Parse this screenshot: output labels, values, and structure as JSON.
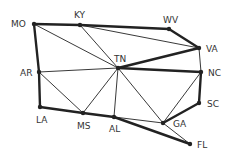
{
  "diagram": {
    "type": "graph",
    "nodes": [
      {
        "id": "MO",
        "label": "MO",
        "x": 34,
        "y": 24,
        "lx": 11,
        "ly": 19
      },
      {
        "id": "KY",
        "label": "KY",
        "x": 80,
        "y": 25,
        "lx": 74,
        "ly": 10
      },
      {
        "id": "WV",
        "label": "WV",
        "x": 169,
        "y": 29,
        "lx": 163,
        "ly": 15
      },
      {
        "id": "VA",
        "label": "VA",
        "x": 199,
        "y": 48,
        "lx": 206,
        "ly": 44
      },
      {
        "id": "TN",
        "label": "TN",
        "x": 118,
        "y": 68,
        "lx": 114,
        "ly": 54
      },
      {
        "id": "NC",
        "label": "NC",
        "x": 201,
        "y": 72,
        "lx": 208,
        "ly": 68
      },
      {
        "id": "AR",
        "label": "AR",
        "x": 39,
        "y": 72,
        "lx": 20,
        "ly": 68
      },
      {
        "id": "SC",
        "label": "SC",
        "x": 199,
        "y": 103,
        "lx": 207,
        "ly": 99
      },
      {
        "id": "LA",
        "label": "LA",
        "x": 40,
        "y": 107,
        "lx": 36,
        "ly": 115
      },
      {
        "id": "MS",
        "label": "MS",
        "x": 83,
        "y": 113,
        "lx": 77,
        "ly": 121
      },
      {
        "id": "AL",
        "label": "AL",
        "x": 114,
        "y": 117,
        "lx": 109,
        "ly": 124
      },
      {
        "id": "GA",
        "label": "GA",
        "x": 163,
        "y": 123,
        "lx": 173,
        "ly": 119
      },
      {
        "id": "FL",
        "label": "FL",
        "x": 190,
        "y": 144,
        "lx": 197,
        "ly": 140
      }
    ],
    "edges": [
      {
        "from": "MO",
        "to": "KY",
        "bold": true
      },
      {
        "from": "KY",
        "to": "WV",
        "bold": true
      },
      {
        "from": "WV",
        "to": "VA",
        "bold": true
      },
      {
        "from": "KY",
        "to": "VA",
        "bold": false
      },
      {
        "from": "MO",
        "to": "TN",
        "bold": false
      },
      {
        "from": "KY",
        "to": "TN",
        "bold": false
      },
      {
        "from": "TN",
        "to": "VA",
        "bold": true
      },
      {
        "from": "VA",
        "to": "NC",
        "bold": false
      },
      {
        "from": "TN",
        "to": "NC",
        "bold": true
      },
      {
        "from": "MO",
        "to": "AR",
        "bold": true
      },
      {
        "from": "AR",
        "to": "TN",
        "bold": false
      },
      {
        "from": "AR",
        "to": "LA",
        "bold": true
      },
      {
        "from": "AR",
        "to": "MS",
        "bold": false
      },
      {
        "from": "TN",
        "to": "MS",
        "bold": false
      },
      {
        "from": "TN",
        "to": "AL",
        "bold": false
      },
      {
        "from": "TN",
        "to": "GA",
        "bold": false
      },
      {
        "from": "NC",
        "to": "GA",
        "bold": false
      },
      {
        "from": "NC",
        "to": "SC",
        "bold": true
      },
      {
        "from": "SC",
        "to": "GA",
        "bold": true
      },
      {
        "from": "LA",
        "to": "MS",
        "bold": true
      },
      {
        "from": "MS",
        "to": "AL",
        "bold": true
      },
      {
        "from": "AL",
        "to": "GA",
        "bold": false
      },
      {
        "from": "AL",
        "to": "FL",
        "bold": true
      },
      {
        "from": "GA",
        "to": "FL",
        "bold": false
      }
    ]
  }
}
